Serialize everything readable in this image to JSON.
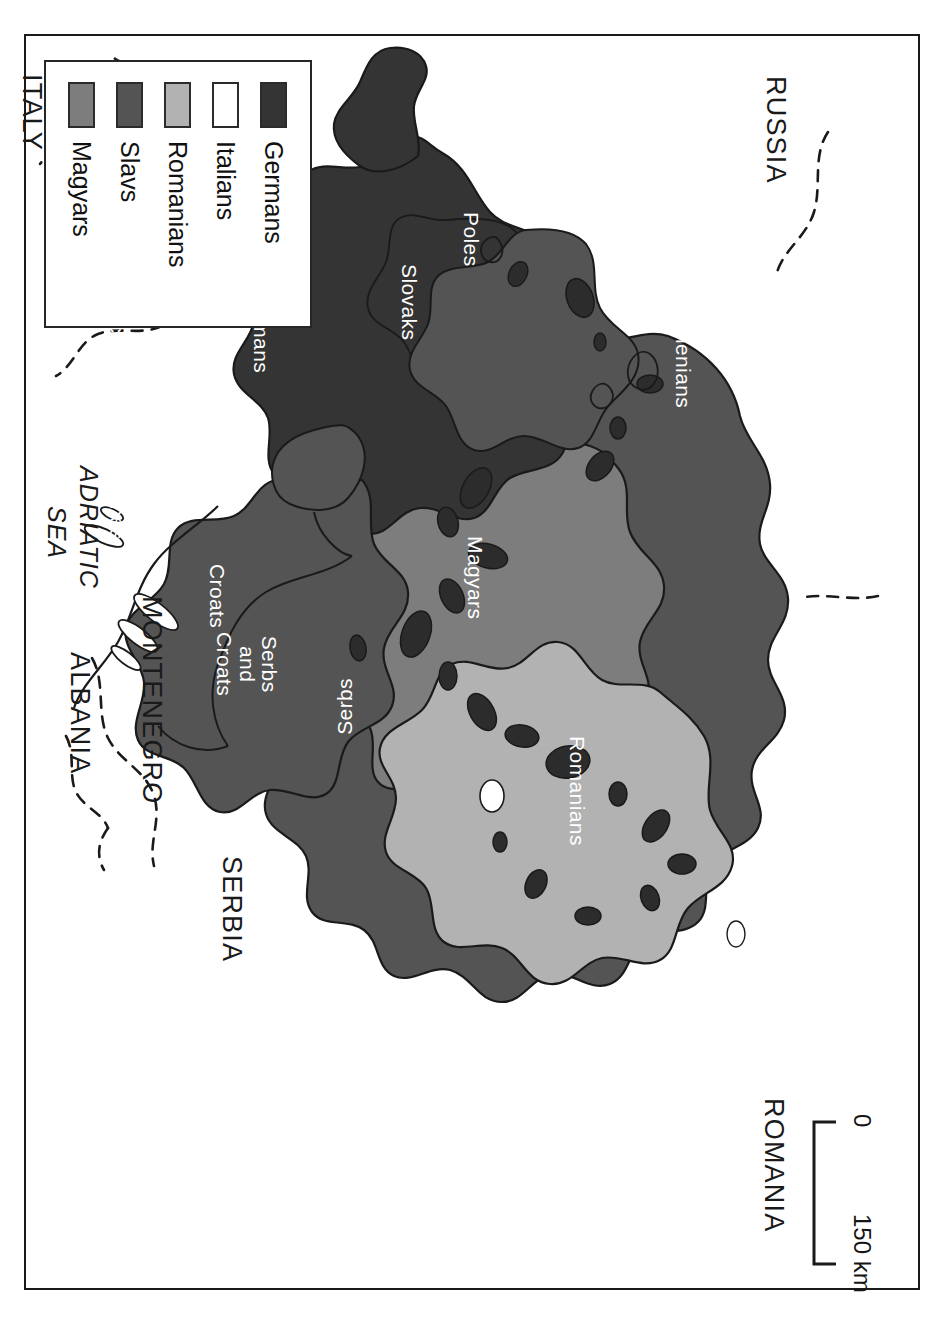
{
  "map": {
    "title": "Ethnographic map of Austria-Hungary",
    "orientation": "rotated-90",
    "background_color": "#ffffff",
    "frame_color": "#1a1a1a"
  },
  "legend": {
    "name": "map-legend",
    "items": [
      {
        "label": "Germans",
        "color": "#343434"
      },
      {
        "label": "Italians",
        "color": "#ffffff"
      },
      {
        "label": "Romanians",
        "color": "#b2b2b2"
      },
      {
        "label": "Slavs",
        "color": "#545454"
      },
      {
        "label": "Magyars",
        "color": "#7d7d7d"
      }
    ]
  },
  "scale_bar": {
    "name": "scale-bar",
    "start_label": "0",
    "end_label": "150 km",
    "unit": "km",
    "length_value": 150
  },
  "country_labels": [
    {
      "id": "russia",
      "text": "RUSSIA"
    },
    {
      "id": "romania",
      "text": "ROMANIA"
    },
    {
      "id": "serbia",
      "text": "SERBIA"
    },
    {
      "id": "montenegro",
      "text": "MONTENEGRO"
    },
    {
      "id": "albania",
      "text": "ALBANIA"
    },
    {
      "id": "germany",
      "text": "GERMANY"
    },
    {
      "id": "switzerland",
      "text": "SWITZ."
    },
    {
      "id": "italy",
      "text": "ITALY"
    }
  ],
  "sea_labels": [
    {
      "id": "adriatic",
      "line1": "ADRIATIC",
      "line2": "SEA"
    }
  ],
  "ethnic_labels": [
    {
      "id": "ruthenians",
      "text": "Ruthenians",
      "color": "#ffffff",
      "group": "Slavs"
    },
    {
      "id": "poles",
      "text": "Poles",
      "color": "#ffffff",
      "group": "Slavs"
    },
    {
      "id": "slovaks",
      "text": "Slovaks",
      "color": "#ffffff",
      "group": "Slavs"
    },
    {
      "id": "czechs",
      "text": "Czechs",
      "color": "#ffffff",
      "group": "Slavs"
    },
    {
      "id": "slovenes",
      "text": "Slovenes",
      "color": "#ffffff",
      "group": "Slavs"
    },
    {
      "id": "croats",
      "text": "Croats",
      "color": "#ffffff",
      "group": "Slavs"
    },
    {
      "id": "serbs-croats",
      "text": "Serbs\nand\nCroats",
      "color": "#ffffff",
      "group": "Slavs"
    },
    {
      "id": "serbs",
      "text": "Serbs",
      "color": "#ffffff",
      "group": "Slavs"
    },
    {
      "id": "magyars",
      "text": "Magyars",
      "color": "#ffffff",
      "group": "Magyars"
    },
    {
      "id": "romanians",
      "text": "Romanians",
      "color": "#ffffff",
      "group": "Romanians"
    },
    {
      "id": "germans",
      "text": "Germans",
      "color": "#ffffff",
      "group": "Germans"
    },
    {
      "id": "italians",
      "text": "Italians",
      "color": "#111111",
      "group": "Italians"
    }
  ],
  "colors": {
    "germans": "#343434",
    "italians": "#ffffff",
    "romanians": "#b2b2b2",
    "slavs": "#545454",
    "magyars": "#7d7d7d",
    "outline": "#1a1a1a",
    "dashed_border": "#1a1a1a"
  }
}
